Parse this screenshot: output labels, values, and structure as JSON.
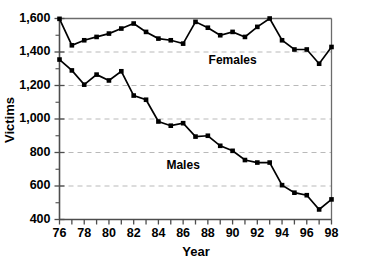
{
  "chart_data": {
    "type": "line",
    "title": "",
    "xlabel": "Year",
    "ylabel": "Victims",
    "xlim": [
      76,
      98
    ],
    "ylim": [
      400,
      1600
    ],
    "grid": true,
    "legend_position": "inline-annotation",
    "x": [
      76,
      77,
      78,
      79,
      80,
      81,
      82,
      83,
      84,
      85,
      86,
      87,
      88,
      89,
      90,
      91,
      92,
      93,
      94,
      95,
      96,
      97,
      98
    ],
    "xticks": [
      76,
      78,
      80,
      82,
      84,
      86,
      88,
      90,
      92,
      94,
      96,
      98
    ],
    "xtick_labels": [
      "76",
      "78",
      "80",
      "82",
      "84",
      "86",
      "88",
      "90",
      "92",
      "94",
      "96",
      "98"
    ],
    "yticks": [
      400,
      600,
      800,
      1000,
      1200,
      1400,
      1600
    ],
    "ytick_labels": [
      "400",
      "600",
      "800",
      "1,000",
      "1,200",
      "1,400",
      "1,600"
    ],
    "yticks_minor": [
      500,
      700,
      900,
      1100,
      1300,
      1500
    ],
    "series": [
      {
        "name": "Females",
        "label": "Females",
        "label_x": 90,
        "label_y": 1330,
        "marker": "square",
        "color": "#000000",
        "values": [
          1598,
          1440,
          1470,
          1490,
          1510,
          1540,
          1570,
          1520,
          1480,
          1470,
          1450,
          1580,
          1545,
          1500,
          1520,
          1490,
          1550,
          1600,
          1470,
          1415,
          1415,
          1330,
          1430
        ]
      },
      {
        "name": "Males",
        "label": "Males",
        "label_x": 86,
        "label_y": 700,
        "marker": "square",
        "color": "#000000",
        "values": [
          1355,
          1290,
          1205,
          1265,
          1230,
          1285,
          1140,
          1115,
          985,
          960,
          975,
          895,
          900,
          840,
          810,
          755,
          740,
          740,
          605,
          560,
          545,
          460,
          520
        ]
      }
    ]
  },
  "axes": {
    "y_title": "Victims",
    "x_title": "Year"
  }
}
